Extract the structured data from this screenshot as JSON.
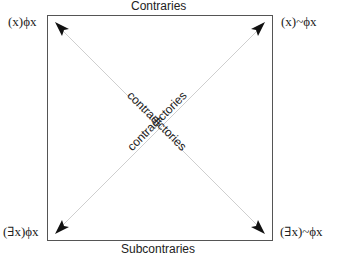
{
  "edges": {
    "top": "Contraries",
    "bottom": "Subcontraries"
  },
  "corners": {
    "top_left": "(x)ϕx",
    "top_right": "(x)~ϕx",
    "bottom_left": "(∃x)ϕx",
    "bottom_right": "(∃x)~ϕx"
  },
  "diagonals": {
    "descending": "contradictories",
    "ascending": "contradictories"
  },
  "colors": {
    "box": "#555555",
    "diagonal": "#cfcfcf",
    "arrow": "#111111",
    "text": "#222222"
  }
}
